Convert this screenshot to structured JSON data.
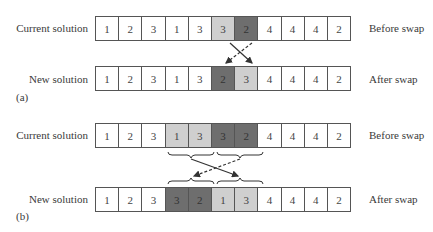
{
  "panels": [
    {
      "id": "a",
      "panel_label": "(a)",
      "current": {
        "label": "Current solution",
        "state_label": "Before swap",
        "cells": [
          {
            "value": "1",
            "shade": "none"
          },
          {
            "value": "2",
            "shade": "none"
          },
          {
            "value": "3",
            "shade": "none"
          },
          {
            "value": "1",
            "shade": "none"
          },
          {
            "value": "3",
            "shade": "none"
          },
          {
            "value": "3",
            "shade": "light"
          },
          {
            "value": "2",
            "shade": "dark"
          },
          {
            "value": "4",
            "shade": "none"
          },
          {
            "value": "4",
            "shade": "none"
          },
          {
            "value": "4",
            "shade": "none"
          },
          {
            "value": "2",
            "shade": "none"
          }
        ]
      },
      "new": {
        "label": "New solution",
        "state_label": "After swap",
        "cells": [
          {
            "value": "1",
            "shade": "none"
          },
          {
            "value": "2",
            "shade": "none"
          },
          {
            "value": "3",
            "shade": "none"
          },
          {
            "value": "1",
            "shade": "none"
          },
          {
            "value": "3",
            "shade": "none"
          },
          {
            "value": "2",
            "shade": "dark"
          },
          {
            "value": "3",
            "shade": "light"
          },
          {
            "value": "4",
            "shade": "none"
          },
          {
            "value": "4",
            "shade": "none"
          },
          {
            "value": "4",
            "shade": "none"
          },
          {
            "value": "2",
            "shade": "none"
          }
        ]
      }
    },
    {
      "id": "b",
      "panel_label": "(b)",
      "current": {
        "label": "Current solution",
        "state_label": "Before swap",
        "cells": [
          {
            "value": "1",
            "shade": "none"
          },
          {
            "value": "2",
            "shade": "none"
          },
          {
            "value": "3",
            "shade": "none"
          },
          {
            "value": "1",
            "shade": "light"
          },
          {
            "value": "3",
            "shade": "light"
          },
          {
            "value": "3",
            "shade": "dark"
          },
          {
            "value": "2",
            "shade": "dark"
          },
          {
            "value": "4",
            "shade": "none"
          },
          {
            "value": "4",
            "shade": "none"
          },
          {
            "value": "4",
            "shade": "none"
          },
          {
            "value": "2",
            "shade": "none"
          }
        ]
      },
      "new": {
        "label": "New solution",
        "state_label": "After swap",
        "cells": [
          {
            "value": "1",
            "shade": "none"
          },
          {
            "value": "2",
            "shade": "none"
          },
          {
            "value": "3",
            "shade": "none"
          },
          {
            "value": "3",
            "shade": "dark"
          },
          {
            "value": "2",
            "shade": "dark"
          },
          {
            "value": "1",
            "shade": "light"
          },
          {
            "value": "3",
            "shade": "light"
          },
          {
            "value": "4",
            "shade": "none"
          },
          {
            "value": "4",
            "shade": "none"
          },
          {
            "value": "4",
            "shade": "none"
          },
          {
            "value": "2",
            "shade": "none"
          }
        ]
      }
    }
  ],
  "colors": {
    "light": "#cfcfcf",
    "dark": "#6e6e6e",
    "border": "#555555"
  }
}
